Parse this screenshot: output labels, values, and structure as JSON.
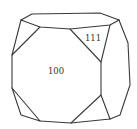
{
  "diagram": {
    "type": "crystal-habit",
    "faces": [
      {
        "id": "face-100",
        "label": "100",
        "x": 56,
        "y": 74
      },
      {
        "id": "face-111",
        "label": "111",
        "x": 93,
        "y": 41
      }
    ],
    "edges": [
      {
        "name": "back-top-edge",
        "points": "21,20 32,14 100,13 119,20"
      },
      {
        "name": "top-face-front-edge",
        "points": "21,20 40,27 70,29 110,25 119,20"
      },
      {
        "name": "left-corner-triangle",
        "points": "21,20 12,55 40,27"
      },
      {
        "name": "left-vertical-edge",
        "points": "12,55 12,88"
      },
      {
        "name": "bottom-left-corner-triangle",
        "points": "12,88 21,115 40,121 12,88"
      },
      {
        "name": "bottom-front-edge",
        "points": "40,121 71,123 110,119"
      },
      {
        "name": "octagon-100-right",
        "points": "70,29 101,62 101,95 71,123"
      },
      {
        "name": "triangle-111-right-edge",
        "points": "110,25 101,62"
      },
      {
        "name": "bottom-right-corner-edge",
        "points": "101,95 110,119"
      },
      {
        "name": "right-side-outline",
        "points": "119,20 128,43 130,85 120,115 110,119"
      }
    ],
    "stroke_color": "#3a3a3a",
    "background": "#ffffff"
  }
}
